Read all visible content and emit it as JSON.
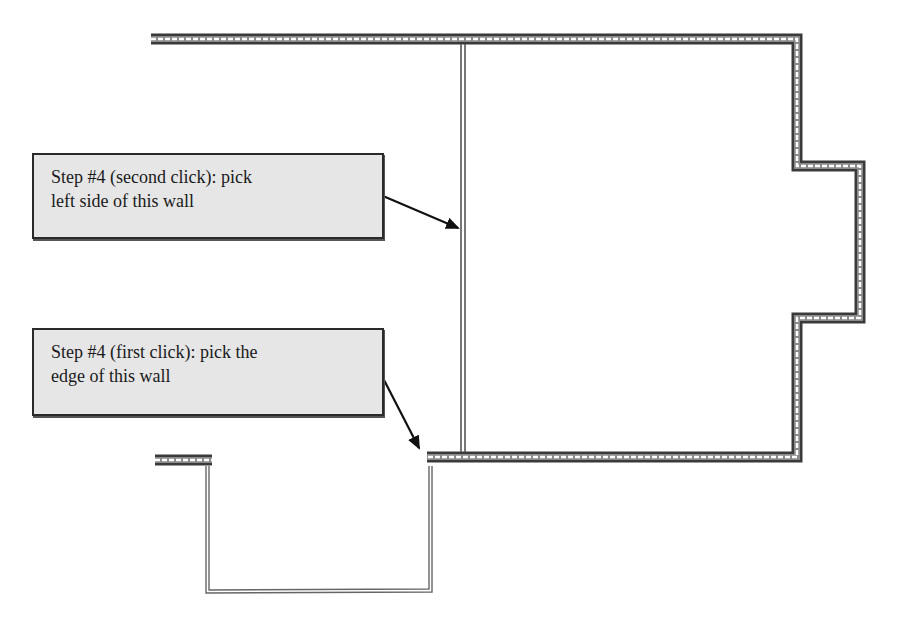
{
  "diagram": {
    "type": "architectural floor plan (wall placement instructions)",
    "colors": {
      "background": "#ffffff",
      "wall_outline": "#333333",
      "wall_core_dash": "#ffffff",
      "thin_wall": "#555555",
      "callout_fill": "#e6e6e6",
      "callout_border": "#2a2a2a",
      "arrow": "#111111"
    },
    "callouts": [
      {
        "id": "second-click",
        "line1": "Step #4 (second click): pick",
        "line2": "left side of this wall",
        "arrow_target": "interior partition wall (left side)"
      },
      {
        "id": "first-click",
        "line1": "Step #4 (first click): pick the",
        "line2": "edge of this wall",
        "arrow_target": "end edge of lower horizontal wall"
      }
    ],
    "walls": [
      {
        "name": "top-exterior-wall",
        "kind": "thick"
      },
      {
        "name": "right-exterior-wall",
        "kind": "thick"
      },
      {
        "name": "bump-out-wall",
        "kind": "thick"
      },
      {
        "name": "bottom-exterior-wall",
        "kind": "thick"
      },
      {
        "name": "stub-wall",
        "kind": "thick"
      },
      {
        "name": "interior-partition-wall",
        "kind": "thin"
      },
      {
        "name": "lower-room-outline",
        "kind": "thin"
      }
    ]
  }
}
